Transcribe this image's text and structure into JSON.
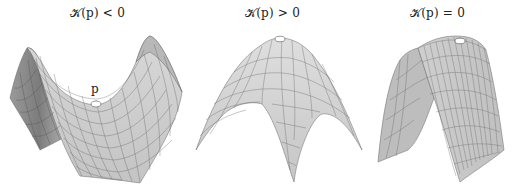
{
  "figure": {
    "panels": [
      {
        "id": "negative",
        "title": "𝒦(p) < 0",
        "surface": "saddle (hyperbolic paraboloid)",
        "point_label": "p"
      },
      {
        "id": "positive",
        "title": "𝒦(p) > 0",
        "surface": "dome (elliptic paraboloid, downward)"
      },
      {
        "id": "zero",
        "title": "𝒦(p) = 0",
        "surface": "parabolic cylinder"
      }
    ],
    "colors": {
      "surface_fill": "#c8c8c8",
      "surface_dark": "#8a8a8a",
      "mesh_line": "#555555",
      "point_fill": "#ffffff",
      "text": "#222222"
    }
  }
}
